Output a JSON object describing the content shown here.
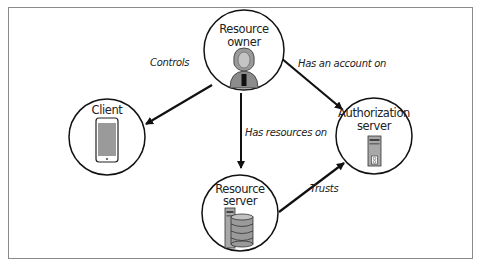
{
  "diagram": {
    "type": "oauth-roles",
    "nodes": [
      {
        "id": "resource_owner",
        "label_lines": [
          "Resource",
          "owner"
        ],
        "icon": "person-icon"
      },
      {
        "id": "client",
        "label_lines": [
          "Client"
        ],
        "icon": "smartphone-icon"
      },
      {
        "id": "authorization_server",
        "label_lines": [
          "Authorization",
          "server"
        ],
        "icon": "server-tower-icon"
      },
      {
        "id": "resource_server",
        "label_lines": [
          "Resource",
          "server"
        ],
        "icon": "database-server-icon"
      }
    ],
    "edges": [
      {
        "from": "resource_owner",
        "to": "client",
        "label": "Controls"
      },
      {
        "from": "resource_owner",
        "to": "authorization_server",
        "label": "Has an account on"
      },
      {
        "from": "resource_owner",
        "to": "resource_server",
        "label": "Has resources on"
      },
      {
        "from": "resource_server",
        "to": "authorization_server",
        "label": "Trusts"
      }
    ]
  },
  "colors": {
    "stroke": "#111111",
    "frame": "#8a8a8a",
    "icon_gray": "#9a9a9a",
    "icon_dark": "#555555"
  }
}
